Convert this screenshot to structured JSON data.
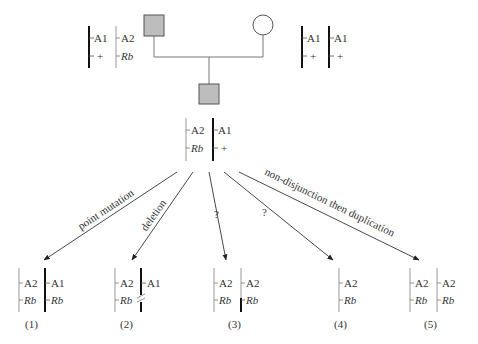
{
  "diagram": {
    "type": "pedigree-chromosome-loss-of-heterozygosity",
    "colors": {
      "affected_fill": "#bdbdbd",
      "line": "#555555",
      "chromosome_dark": "#111111",
      "chromosome_light": "#9a9a9a"
    },
    "parents": {
      "father": {
        "symbol": "square",
        "affected": true,
        "chromosomes": [
          {
            "shade": "dark",
            "loci": [
              "A1",
              "+"
            ]
          },
          {
            "shade": "light",
            "loci": [
              "A2",
              "Rb"
            ]
          }
        ]
      },
      "mother": {
        "symbol": "circle",
        "affected": false,
        "chromosomes": [
          {
            "shade": "dark",
            "loci": [
              "A1",
              "+"
            ]
          },
          {
            "shade": "dark",
            "loci": [
              "A1",
              "+"
            ]
          }
        ]
      }
    },
    "child": {
      "symbol": "square",
      "affected": true,
      "chromosomes": [
        {
          "shade": "light",
          "loci": [
            "A2",
            "Rb"
          ]
        },
        {
          "shade": "dark",
          "loci": [
            "A1",
            "+"
          ]
        }
      ]
    },
    "mechanisms": [
      {
        "label": "point mutation",
        "target": "(1)"
      },
      {
        "label": "deletion",
        "target": "(2)"
      },
      {
        "label": "?",
        "target": "(3)"
      },
      {
        "label": "?",
        "target": "(4)"
      },
      {
        "label": "non-disjunction then duplication",
        "target": "(5)"
      }
    ],
    "outcomes": [
      {
        "id": "(1)",
        "chromosomes": [
          {
            "shade": "light",
            "loci": [
              "A2",
              "Rb"
            ]
          },
          {
            "shade": "dark",
            "loci": [
              "A1",
              "Rb"
            ]
          }
        ]
      },
      {
        "id": "(2)",
        "chromosomes": [
          {
            "shade": "light",
            "loci": [
              "A2",
              "Rb"
            ]
          },
          {
            "shade": "dark",
            "loci": [
              "A1",
              ""
            ],
            "deletion_mark": true
          }
        ]
      },
      {
        "id": "(3)",
        "chromosomes": [
          {
            "shade": "light",
            "loci": [
              "A2",
              "Rb"
            ]
          },
          {
            "shade": "mixed",
            "loci": [
              "A2",
              "Rb"
            ]
          }
        ]
      },
      {
        "id": "(4)",
        "chromosomes": [
          {
            "shade": "light",
            "loci": [
              "A2",
              "Rb"
            ]
          }
        ]
      },
      {
        "id": "(5)",
        "chromosomes": [
          {
            "shade": "light",
            "loci": [
              "A2",
              "Rb"
            ]
          },
          {
            "shade": "light",
            "loci": [
              "A2",
              "Rb"
            ]
          }
        ]
      }
    ]
  }
}
